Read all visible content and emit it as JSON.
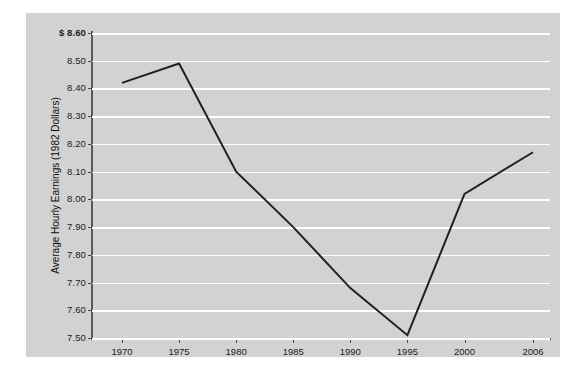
{
  "chart_data": {
    "type": "line",
    "title": "",
    "xlabel": "",
    "ylabel": "Average Hourly Earnings (1982 Dollars)",
    "y_axis_prefix": "$",
    "x": [
      1970,
      1975,
      1980,
      1985,
      1990,
      1995,
      2000,
      2006
    ],
    "xtick_labels": [
      "1970",
      "1975",
      "1980",
      "1985",
      "1990",
      "1995",
      "2000",
      "2006"
    ],
    "values": [
      8.42,
      8.49,
      8.1,
      7.9,
      7.68,
      7.51,
      8.02,
      8.17
    ],
    "ylim": [
      7.5,
      8.6
    ],
    "ytick_values": [
      8.6,
      8.5,
      8.4,
      8.3,
      8.2,
      8.1,
      8.0,
      7.9,
      7.8,
      7.7,
      7.6,
      7.5
    ],
    "ytick_labels": [
      "$ 8.60",
      "8.50",
      "8.40",
      "8.30",
      "8.20",
      "8.10",
      "8.00",
      "7.90",
      "7.80",
      "7.70",
      "7.60",
      "7.50"
    ],
    "grid": true,
    "legend": false,
    "legend_position": "none",
    "line_color": "#202020",
    "grid_color": "#ffffff",
    "panel_color": "#d2d2d2",
    "background_color": "#ffffff",
    "axis_color": "#5a5a5a"
  }
}
